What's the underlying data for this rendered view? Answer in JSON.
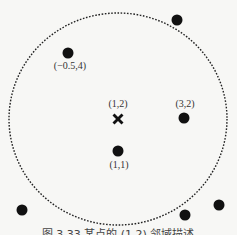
{
  "diagram": {
    "circle": {
      "cx": 118,
      "cy": 119,
      "rx": 109,
      "ry": 106,
      "style": "dotted"
    },
    "cross": {
      "x": 118,
      "y": 119,
      "label": "(1,2)",
      "label_x": 118,
      "label_y": 107
    },
    "points": [
      {
        "x": 68,
        "y": 53,
        "label": "(−0.5,4)",
        "label_x": 70,
        "label_y": 69
      },
      {
        "x": 177,
        "y": 20,
        "label": ""
      },
      {
        "x": 184,
        "y": 118,
        "label": "(3,2)",
        "label_x": 185,
        "label_y": 107
      },
      {
        "x": 118,
        "y": 151,
        "label": "(1,1)",
        "label_x": 119,
        "label_y": 168
      },
      {
        "x": 22,
        "y": 210,
        "label": ""
      },
      {
        "x": 185,
        "y": 215,
        "label": ""
      },
      {
        "x": 219,
        "y": 205,
        "label": ""
      }
    ],
    "caption": "图 3.33   某点的 (1,2) 邻域描述"
  }
}
